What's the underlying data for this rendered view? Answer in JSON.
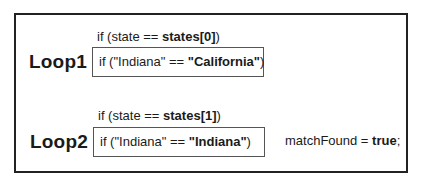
{
  "diagram": {
    "loops": [
      {
        "label": "Loop1",
        "condition": {
          "prefix": "if (state == ",
          "bold": "states[0]",
          "suffix": ")"
        },
        "evaluation": {
          "prefix": "if (\"Indiana\" == ",
          "bold": "\"California\"",
          "suffix": ")"
        },
        "result": null
      },
      {
        "label": "Loop2",
        "condition": {
          "prefix": "if (state == ",
          "bold": "states[1]",
          "suffix": ")"
        },
        "evaluation": {
          "prefix": "if (\"Indiana\" == ",
          "bold": "\"Indiana\"",
          "suffix": ")"
        },
        "result": {
          "prefix": "matchFound = ",
          "bold": "true",
          "suffix": ";"
        }
      }
    ]
  }
}
